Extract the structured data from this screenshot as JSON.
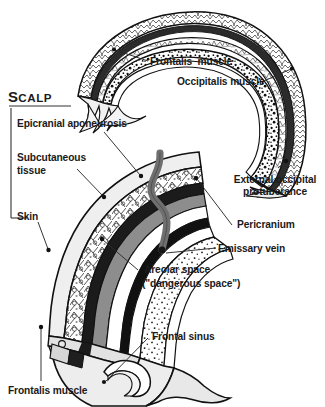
{
  "figure": {
    "kind": "anatomical-illustration",
    "background_color": "#ffffff",
    "ink_color": "#1a1a1a"
  },
  "bracket": {
    "heading_lead": "S",
    "heading_rest": "CALP"
  },
  "labels": {
    "frontalis_muscle_top": "Frontalis  muscle",
    "occipitalis_muscle": "Occipitalis muscle",
    "external_occipital_protuberance_line1": "External occipital",
    "external_occipital_protuberance_line2": "protuberance",
    "epicranial_aponeurosis": "Epicranial aponeurosis",
    "subcutaneous_tissue_line1": "Subcutaneous",
    "subcutaneous_tissue_line2": "tissue",
    "skin": "Skin",
    "pericranium": "Pericranium",
    "emissary_vein": "Emissary vein",
    "areolar_space_line1": "Areolar space",
    "areolar_space_line2": "(\"dangerous space\")",
    "frontal_sinus": "Frontal sinus",
    "frontalis_muscle_bottom": "Frontalis muscle"
  },
  "colors": {
    "outline": "#111111",
    "aponeurosis_gray": "#7d7d7d",
    "emissary_vein_gray": "#6f6f6f",
    "bone_fill": "#ffffff",
    "tissue_fill": "#efefef",
    "pale_fill": "#e9e9e9",
    "leader_line": "#2b2b2b"
  },
  "structures": [
    "skin",
    "subcutaneous tissue",
    "epicranial aponeurosis",
    "areolar space (dangerous space)",
    "pericranium",
    "outer table of skull",
    "diploe",
    "inner table of skull",
    "frontal sinus",
    "emissary vein",
    "frontalis muscle",
    "occipitalis muscle",
    "external occipital protuberance"
  ]
}
